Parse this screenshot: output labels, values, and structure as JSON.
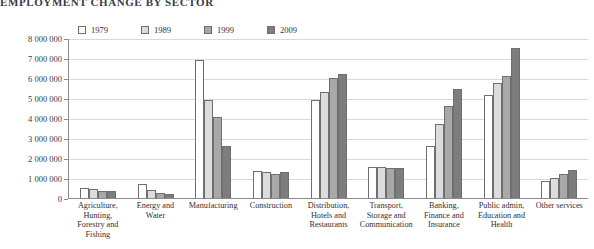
{
  "chart_data": {
    "type": "bar",
    "title": "EMPLOYMENT CHANGE BY SECTOR",
    "xlabel": "",
    "ylabel": "",
    "ylim": [
      0,
      8000000
    ],
    "grid": true,
    "legend_position": "top-left",
    "ytick_labels": [
      "8 000 000",
      "7 000 000",
      "6 000 000",
      "5 000 000",
      "4 000 000",
      "3 000 000",
      "2 000 000",
      "1 000 000",
      "0"
    ],
    "ytick_values": [
      8000000,
      7000000,
      6000000,
      5000000,
      4000000,
      3000000,
      2000000,
      1000000,
      0
    ],
    "categories": [
      "Agriculture, Hunting, Forestry and Fishing",
      "Energy and Water",
      "Manufacturing",
      "Construction",
      "Distribution, Hotels and Restaurants",
      "Transport, Storage and Communication",
      "Banking, Finance and Insurance",
      "Public admin, Education and Health",
      "Other services"
    ],
    "series": [
      {
        "name": "1979",
        "color": "#ffffff",
        "values": [
          500000,
          720000,
          6900000,
          1350000,
          4900000,
          1550000,
          2600000,
          5150000,
          850000
        ]
      },
      {
        "name": "1989",
        "color": "#dcdcdc",
        "values": [
          450000,
          400000,
          4900000,
          1300000,
          5300000,
          1560000,
          3700000,
          5750000,
          1000000
        ]
      },
      {
        "name": "1999",
        "color": "#a8a8a8",
        "values": [
          350000,
          250000,
          4050000,
          1200000,
          6000000,
          1480000,
          4600000,
          6100000,
          1200000
        ]
      },
      {
        "name": "2009",
        "color": "#7d7d7d",
        "values": [
          350000,
          200000,
          2600000,
          1300000,
          6200000,
          1500000,
          5450000,
          7500000,
          1400000
        ]
      }
    ]
  }
}
